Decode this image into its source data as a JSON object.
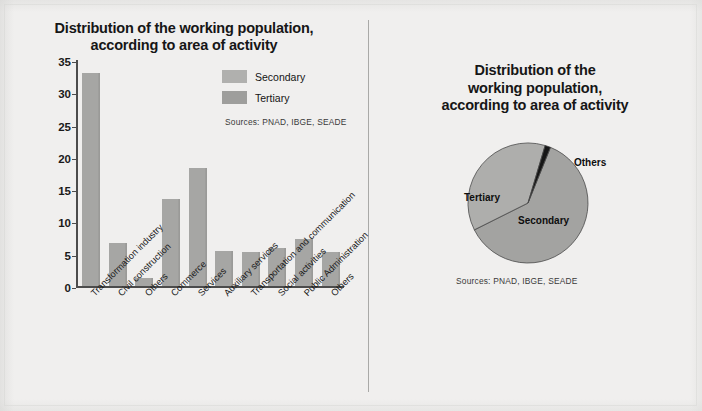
{
  "page": {
    "background_color": "#f0efee",
    "divider_color": "#a9a9a7"
  },
  "bar_chart": {
    "title_line1": "Distribution of the working population,",
    "title_line2": "according to area of activity",
    "sources": "Sources: PNAD, IBGE, SEADE",
    "legend": [
      {
        "label": "Secondary",
        "color": "#b0b0ae"
      },
      {
        "label": "Tertiary",
        "color": "#9e9e9c"
      }
    ]
  },
  "pie_chart": {
    "title_line1": "Distribution of the",
    "title_line2": "working population,",
    "title_line3": "according to area of activity",
    "sources": "Sources: PNAD, IBGE, SEADE",
    "labels": {
      "tertiary": "Tertiary",
      "secondary": "Secondary",
      "others": "Others"
    }
  },
  "chart_data": [
    {
      "type": "bar",
      "title": "Distribution of the working population, according to area of activity",
      "xlabel": "",
      "ylabel": "",
      "ylim": [
        0,
        35
      ],
      "yticks": [
        0,
        5,
        10,
        15,
        20,
        25,
        30,
        35
      ],
      "grid": false,
      "bar_color": "#a6a6a4",
      "legend": [
        "Secondary",
        "Tertiary"
      ],
      "legend_position": "upper right",
      "annotations": [
        "Sources: PNAD, IBGE, SEADE"
      ],
      "categories": [
        "Transformation industry",
        "Civil construction",
        "Others",
        "Commerce",
        "Services",
        "Auxiliary services",
        "Transportation and communication",
        "Social activities",
        "Public Administration",
        "Others"
      ],
      "values": [
        33.0,
        6.6,
        1.2,
        13.5,
        18.2,
        5.5,
        5.2,
        5.9,
        7.3,
        5.2
      ],
      "group_of": [
        "Secondary",
        "Secondary",
        "Secondary",
        "Tertiary",
        "Tertiary",
        "Tertiary",
        "Tertiary",
        "Tertiary",
        "Tertiary",
        "Tertiary"
      ]
    },
    {
      "type": "pie",
      "title": "Distribution of the working population, according to area of activity",
      "annotations": [
        "Sources: PNAD, IBGE, SEADE"
      ],
      "legend_position": "none",
      "labels": [
        "Tertiary",
        "Secondary",
        "Others"
      ],
      "values": [
        61.5,
        37.0,
        1.5
      ],
      "colors": [
        "#a3a3a1",
        "#aeaeac",
        "#161616"
      ],
      "start_angle_deg": 22
    }
  ]
}
